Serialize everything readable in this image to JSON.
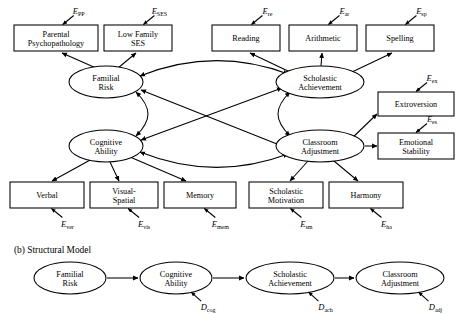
{
  "figure": {
    "panel_b_label": "(b) Structural Model"
  },
  "measurement_model": {
    "indicators_top": [
      {
        "id": "parental-psychopathology",
        "line1": "Parental",
        "line2": "Psychopathology",
        "error": "E",
        "error_sub": "PP",
        "x": 14,
        "y": 25,
        "w": 84,
        "h": 26
      },
      {
        "id": "low-family-ses",
        "line1": "Low Family",
        "line2": "SES",
        "error": "E",
        "error_sub": "SES",
        "x": 104,
        "y": 25,
        "w": 68,
        "h": 26
      },
      {
        "id": "reading",
        "line1": "Reading",
        "line2": "",
        "error": "E",
        "error_sub": "re",
        "x": 212,
        "y": 25,
        "w": 68,
        "h": 26
      },
      {
        "id": "arithmetic",
        "line1": "Arithmetic",
        "line2": "",
        "error": "E",
        "error_sub": "ar",
        "x": 289,
        "y": 25,
        "w": 68,
        "h": 26
      },
      {
        "id": "spelling",
        "line1": "Spelling",
        "line2": "",
        "error": "E",
        "error_sub": "sp",
        "x": 366,
        "y": 25,
        "w": 68,
        "h": 26
      }
    ],
    "indicators_right": [
      {
        "id": "extroversion",
        "line1": "Extroversion",
        "line2": "",
        "error": "E",
        "error_sub": "ex",
        "x": 378,
        "y": 92,
        "w": 76,
        "h": 24
      },
      {
        "id": "emotional-stability",
        "line1": "Emotional",
        "line2": "Stability",
        "error": "E",
        "error_sub": "es",
        "x": 378,
        "y": 133,
        "w": 76,
        "h": 26
      }
    ],
    "indicators_bottom": [
      {
        "id": "verbal",
        "line1": "Verbal",
        "line2": "",
        "error": "E",
        "error_sub": "ver",
        "x": 10,
        "y": 182,
        "w": 74,
        "h": 26
      },
      {
        "id": "visual-spatial",
        "line1": "Visual-",
        "line2": "Spatial",
        "error": "E",
        "error_sub": "vis",
        "x": 90,
        "y": 182,
        "w": 68,
        "h": 26
      },
      {
        "id": "memory",
        "line1": "Memory",
        "line2": "",
        "error": "E",
        "error_sub": "mem",
        "x": 164,
        "y": 182,
        "w": 72,
        "h": 26
      },
      {
        "id": "scholastic-motivation",
        "line1": "Scholastic",
        "line2": "Motivation",
        "error": "E",
        "error_sub": "sm",
        "x": 249,
        "y": 182,
        "w": 74,
        "h": 26
      },
      {
        "id": "harmony",
        "line1": "Harmony",
        "line2": "",
        "error": "E",
        "error_sub": "ha",
        "x": 329,
        "y": 182,
        "w": 74,
        "h": 26
      }
    ],
    "factors": [
      {
        "id": "familial-risk",
        "line1": "Familial",
        "line2": "Risk",
        "cx": 106,
        "cy": 82,
        "rx": 37,
        "ry": 16
      },
      {
        "id": "cognitive-ability",
        "line1": "Cognitive",
        "line2": "Ability",
        "cx": 106,
        "cy": 146,
        "rx": 37,
        "ry": 16
      },
      {
        "id": "scholastic-achievement",
        "line1": "Scholastic",
        "line2": "Achievement",
        "cx": 320,
        "cy": 82,
        "rx": 44,
        "ry": 16
      },
      {
        "id": "classroom-adjustment",
        "line1": "Classroom",
        "line2": "Adjustment",
        "cx": 320,
        "cy": 146,
        "rx": 44,
        "ry": 16
      }
    ]
  },
  "structural_model": {
    "factors": [
      {
        "id": "familial-risk",
        "line1": "Familial",
        "line2": "Risk",
        "cx": 70,
        "cy": 278,
        "rx": 36,
        "ry": 16,
        "disturbance": "",
        "disturbance_sub": ""
      },
      {
        "id": "cognitive-ability",
        "line1": "Cognitive",
        "line2": "Ability",
        "cx": 176,
        "cy": 278,
        "rx": 36,
        "ry": 16,
        "disturbance": "D",
        "disturbance_sub": "cog"
      },
      {
        "id": "scholastic-achievement",
        "line1": "Scholastic",
        "line2": "Achievement",
        "cx": 290,
        "cy": 278,
        "rx": 44,
        "ry": 16,
        "disturbance": "D",
        "disturbance_sub": "ach"
      },
      {
        "id": "classroom-adjustment",
        "line1": "Classroom",
        "line2": "Adjustment",
        "cx": 400,
        "cy": 278,
        "rx": 44,
        "ry": 16,
        "disturbance": "D",
        "disturbance_sub": "adj"
      }
    ]
  },
  "colors": {
    "stroke": "#000000",
    "fill": "#ffffff",
    "background": "#ffffff"
  }
}
